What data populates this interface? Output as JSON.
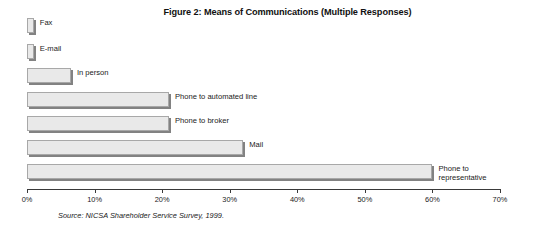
{
  "chart_data": {
    "type": "bar",
    "orientation": "horizontal",
    "title": "Figure 2: Means of Communications (Multiple Responses)",
    "xlabel": "",
    "ylabel": "",
    "xlim": [
      0,
      70
    ],
    "grid": false,
    "legend": false,
    "value_unit": "percent",
    "categories": [
      "Fax",
      "E-mail",
      "In person",
      "Phone to automated line",
      "Phone to broker",
      "Mail",
      "Phone to\nrepresentative"
    ],
    "values": [
      1,
      1,
      6.5,
      21,
      21,
      32,
      60
    ],
    "xticks": [
      0,
      10,
      20,
      30,
      40,
      50,
      60,
      70
    ],
    "xticklabels": [
      "0%",
      "10%",
      "20%",
      "30%",
      "40%",
      "50%",
      "60%",
      "70%"
    ],
    "bar_color": "#e9e9e9",
    "bar_border_color": "#a8a8a8",
    "bar_shadow_color": "#828282",
    "axis_color": "#3a3a3a"
  },
  "source_note": "Source: NICSA Shareholder Service Survey, 1999."
}
